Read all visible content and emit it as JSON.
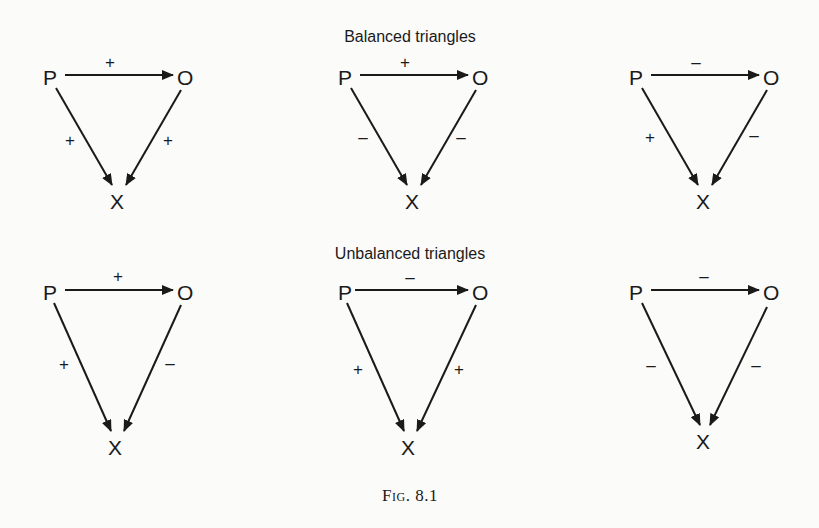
{
  "titles": {
    "balanced": "Balanced triangles",
    "unbalanced": "Unbalanced triangles"
  },
  "caption": "Fig. 8.1",
  "node_labels": {
    "p": "P",
    "o": "O",
    "x": "X"
  },
  "triangles": [
    {
      "group": "balanced",
      "p_o": "+",
      "p_x": "+",
      "o_x": "+"
    },
    {
      "group": "balanced",
      "p_o": "+",
      "p_x": "–",
      "o_x": "–"
    },
    {
      "group": "balanced",
      "p_o": "–",
      "p_x": "+",
      "o_x": "–"
    },
    {
      "group": "unbalanced",
      "p_o": "+",
      "p_x": "+",
      "o_x": "–"
    },
    {
      "group": "unbalanced",
      "p_o": "–",
      "p_x": "+",
      "o_x": "+"
    },
    {
      "group": "unbalanced",
      "p_o": "–",
      "p_x": "–",
      "o_x": "–"
    }
  ]
}
